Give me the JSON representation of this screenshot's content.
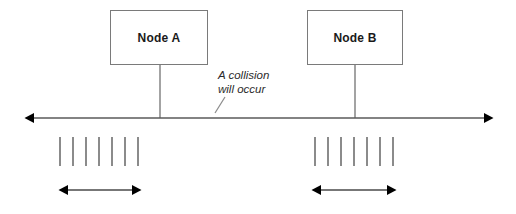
{
  "diagram": {
    "background_color": "#ffffff",
    "line_color": "#7a7a7a",
    "arrow_color": "#000000",
    "text_color": "#1a1a1a",
    "nodes": [
      {
        "id": "node-a",
        "label": "Node A",
        "box": {
          "x": 110,
          "y": 10,
          "width": 98,
          "height": 55
        },
        "connector_x": 160,
        "connector_y1": 65,
        "connector_y2": 118
      },
      {
        "id": "node-b",
        "label": "Node B",
        "box": {
          "x": 307,
          "y": 10,
          "width": 96,
          "height": 55
        },
        "connector_x": 355,
        "connector_y1": 65,
        "connector_y2": 118
      }
    ],
    "annotation": {
      "line1": "A collision",
      "line2": "will occur",
      "x": 218,
      "y": 68,
      "leader_line": {
        "x1": 225,
        "y1": 97,
        "x2": 215,
        "y2": 113
      }
    },
    "medium_axis": {
      "y": 118,
      "x_start": 28,
      "x_end": 490,
      "arrowheads": "both"
    },
    "transmission_groups": [
      {
        "id": "left-burst",
        "tick_count": 7,
        "tick_x_start": 60,
        "tick_spacing": 13,
        "tick_y_top": 137,
        "tick_y_bottom": 166,
        "span_arrow": {
          "y": 190,
          "x_start": 60,
          "x_end": 140
        }
      },
      {
        "id": "right-burst",
        "tick_count": 7,
        "tick_x_start": 315,
        "tick_spacing": 13,
        "tick_y_top": 137,
        "tick_y_bottom": 166,
        "span_arrow": {
          "y": 190,
          "x_start": 313,
          "x_end": 395
        }
      }
    ]
  }
}
